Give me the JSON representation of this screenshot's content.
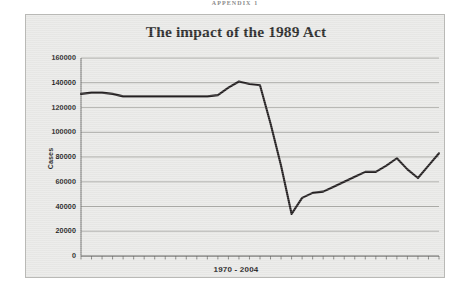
{
  "page": {
    "header_text": "APPENDIX 1"
  },
  "colors": {
    "panel_background": "#e9e9e7",
    "panel_border": "#b9b9b6",
    "gridline": "#9a9a97",
    "axis": "#6f6f6c",
    "series_line": "#231f20",
    "text": "#1b1b1b",
    "title": "#2b2b2b"
  },
  "chart_data": {
    "type": "line",
    "title": "The impact of the 1989 Act",
    "xlabel": "1970 - 2004",
    "ylabel": "Cases",
    "ylim": [
      0,
      160000
    ],
    "ytick_labels": [
      "160000",
      "140000",
      "120000",
      "100000",
      "80000",
      "60000",
      "40000",
      "20000",
      "0"
    ],
    "ytick_values": [
      160000,
      140000,
      120000,
      100000,
      80000,
      60000,
      40000,
      20000,
      0
    ],
    "grid": true,
    "legend": "none",
    "xtick_labels_shown": false,
    "x_tick_count": 35,
    "categories": [
      "1970",
      "1971",
      "1972",
      "1973",
      "1974",
      "1975",
      "1976",
      "1977",
      "1978",
      "1979",
      "1980",
      "1981",
      "1982",
      "1983",
      "1984",
      "1985",
      "1986",
      "1987",
      "1988",
      "1989",
      "1990",
      "1991",
      "1992",
      "1993",
      "1994",
      "1995",
      "1996",
      "1997",
      "1998",
      "1999",
      "2000",
      "2001",
      "2002",
      "2003",
      "2004"
    ],
    "series": [
      {
        "name": "Cases",
        "values": [
          131000,
          132000,
          132000,
          131000,
          129000,
          129000,
          129000,
          129000,
          129000,
          129000,
          129000,
          129000,
          129000,
          130000,
          136000,
          141000,
          139000,
          138000,
          107000,
          73000,
          34000,
          47000,
          51000,
          52000,
          56000,
          60000,
          64000,
          68000,
          68000,
          73000,
          79000,
          70000,
          63000,
          73000,
          83000
        ]
      }
    ]
  }
}
